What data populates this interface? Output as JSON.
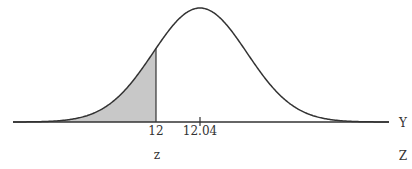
{
  "chart_data": {
    "type": "area",
    "title": "",
    "mean": 12.04,
    "shaded_region": {
      "from": "-inf",
      "to": 12
    },
    "tick_labels": [
      "12",
      "12.04"
    ],
    "xlabel_row1": "Y",
    "xlabel_row2": "Z",
    "z_row_label": "z",
    "colors": {
      "curve": "#333333",
      "shade": "#c8c8c8",
      "axis": "#333333"
    }
  },
  "labels": {
    "tick_12": "12",
    "tick_mean": "12.04",
    "z_value": "z",
    "axis_y": "Y",
    "axis_z": "Z"
  }
}
